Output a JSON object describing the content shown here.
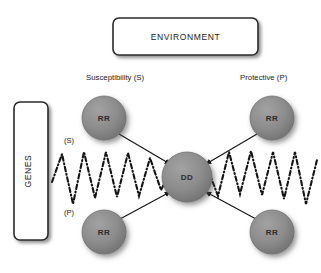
{
  "figure": {
    "background_color": "#ffffff",
    "node_fill_color": "#8a8a8a",
    "node_stroke_color": "#6f6f6f",
    "line_color": "#1a1a1a",
    "box_fill_color": "#ffffff",
    "box_stroke_color": "#2a2a2a"
  },
  "boxes": {
    "environment": {
      "label": "ENVIRONMENT"
    },
    "genes": {
      "label": "GENES"
    }
  },
  "column_headers": {
    "left": "Susceptibility (S)",
    "right": "Protective (P)"
  },
  "wave_labels": {
    "susceptibility": "(S)",
    "protective": "(P)"
  },
  "nodes": [
    {
      "id": "rr-top-left",
      "label": "RR",
      "cx": 104,
      "cy": 118,
      "r": 22
    },
    {
      "id": "rr-top-right",
      "label": "RR",
      "cx": 272,
      "cy": 118,
      "r": 22
    },
    {
      "id": "dd-center",
      "label": "DD",
      "cx": 187,
      "cy": 177,
      "r": 25
    },
    {
      "id": "rr-bottom-left",
      "label": "RR",
      "cx": 104,
      "cy": 232,
      "r": 22
    },
    {
      "id": "rr-bottom-right",
      "label": "RR",
      "cx": 272,
      "cy": 232,
      "r": 22
    }
  ],
  "edges": [
    {
      "id": "edge-top-left-to-dd",
      "from": "rr-top-left",
      "to": "dd-center",
      "arrow": "to"
    },
    {
      "id": "edge-top-right-to-dd",
      "from": "rr-top-right",
      "to": "dd-center",
      "arrow": "to"
    },
    {
      "id": "edge-bottom-left-to-dd",
      "from": "rr-bottom-left",
      "to": "dd-center",
      "arrow": "to"
    },
    {
      "id": "edge-bottom-right-to-dd",
      "from": "rr-bottom-right",
      "to": "dd-center",
      "arrow": "to"
    }
  ],
  "waves": {
    "left": {
      "id": "wave-left",
      "style": "dash-dot-zigzag"
    },
    "right": {
      "id": "wave-right",
      "style": "dash-dot-zigzag"
    }
  }
}
